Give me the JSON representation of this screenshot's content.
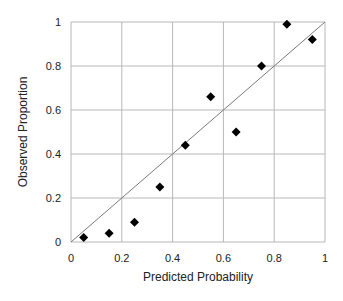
{
  "chart_data": {
    "type": "scatter",
    "title": "",
    "xlabel": "Predicted Probability",
    "ylabel": "Observed Proportion",
    "xlim": [
      0,
      1
    ],
    "ylim": [
      0,
      1
    ],
    "xticks": [
      "0",
      "0.2",
      "0.4",
      "0.6",
      "0.8",
      "1"
    ],
    "yticks": [
      "0",
      "0.2",
      "0.4",
      "0.6",
      "0.8",
      "1"
    ],
    "grid": true,
    "legend": null,
    "series": [
      {
        "name": "Observed vs Predicted",
        "marker": "diamond",
        "color": "#000000",
        "x": [
          0.05,
          0.15,
          0.25,
          0.35,
          0.45,
          0.55,
          0.65,
          0.75,
          0.85,
          0.95
        ],
        "y": [
          0.02,
          0.04,
          0.09,
          0.25,
          0.44,
          0.66,
          0.5,
          0.8,
          0.99,
          0.92
        ]
      }
    ],
    "reference_line": {
      "name": "perfect calibration (y = x)",
      "from": [
        0,
        0
      ],
      "to": [
        1,
        1
      ],
      "color": "#777777"
    }
  },
  "style": {
    "grid_color": "#b8b8b8",
    "axis_color": "#999999",
    "marker_color": "#000000",
    "line_color": "#7a7a7a"
  }
}
